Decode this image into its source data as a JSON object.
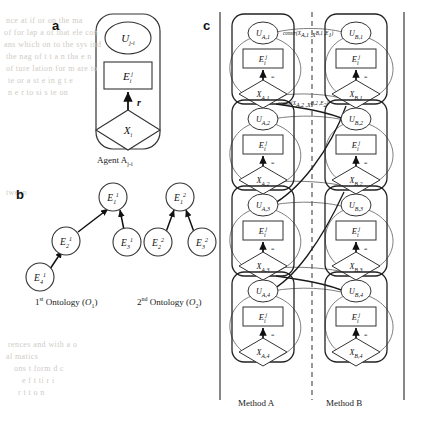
{
  "figure": {
    "panels": [
      {
        "id": "a",
        "letter": "a"
      },
      {
        "id": "b",
        "letter": "b"
      },
      {
        "id": "c",
        "letter": "c"
      }
    ]
  },
  "panel_a": {
    "letter": "a",
    "utility_node": {
      "base": "U",
      "sub": "j-i"
    },
    "entity_node": {
      "base": "E",
      "sub": "i",
      "sup": "j"
    },
    "decision_node": {
      "base": "X",
      "sub": "i"
    },
    "edge_label": "r",
    "caption": {
      "text": "Agent A",
      "sub": "j-i"
    }
  },
  "panel_b": {
    "letter": "b",
    "ontology_1": {
      "caption_prefix": "1",
      "caption_ordinal": "st",
      "caption_text": " Ontology (",
      "caption_symbol": "O",
      "caption_symbol_sub": "1",
      "caption_close": ")",
      "nodes": [
        {
          "id": "E11",
          "base": "E",
          "sub": "1",
          "sup": "1",
          "x": 118,
          "y": 198
        },
        {
          "id": "E21",
          "base": "E",
          "sub": "2",
          "sup": "1",
          "x": 68,
          "y": 241
        },
        {
          "id": "E31",
          "base": "E",
          "sub": "3",
          "sup": "1",
          "x": 118,
          "y": 241
        },
        {
          "id": "E41",
          "base": "E",
          "sub": "4",
          "sup": "1",
          "x": 40,
          "y": 277
        }
      ],
      "edges": [
        {
          "from": "E21",
          "to": "E11"
        },
        {
          "from": "E31",
          "to": "E11"
        },
        {
          "from": "E41",
          "to": "E21"
        }
      ]
    },
    "ontology_2": {
      "caption_prefix": "2",
      "caption_ordinal": "nd",
      "caption_text": " Ontology (",
      "caption_symbol": "O",
      "caption_symbol_sub": "2",
      "caption_close": ")",
      "nodes": [
        {
          "id": "E12",
          "base": "E",
          "sub": "1",
          "sup": "2",
          "x": 178,
          "y": 198
        },
        {
          "id": "E22",
          "base": "E",
          "sub": "2",
          "sup": "2",
          "x": 155,
          "y": 241
        },
        {
          "id": "E32",
          "base": "E",
          "sub": "3",
          "sup": "2",
          "x": 200,
          "y": 241
        }
      ],
      "edges": [
        {
          "from": "E22",
          "to": "E12"
        },
        {
          "from": "E32",
          "to": "E12"
        }
      ]
    }
  },
  "panel_c": {
    "letter": "c",
    "method_a_label": "Method A",
    "method_b_label": "Method B",
    "equality_symbol": "=",
    "edge_label": "r",
    "column_a": {
      "name": "Method A",
      "agents": [
        {
          "utility": {
            "base": "U",
            "sub": "A,1"
          },
          "entity": {
            "base": "E",
            "sub": "i",
            "sup": "j"
          },
          "decision": {
            "base": "X",
            "sub": "A,1"
          }
        },
        {
          "utility": {
            "base": "U",
            "sub": "A,2"
          },
          "entity": {
            "base": "E",
            "sub": "i",
            "sup": "j"
          },
          "decision": {
            "base": "X",
            "sub": "A,2"
          }
        },
        {
          "utility": {
            "base": "U",
            "sub": "A,3"
          },
          "entity": {
            "base": "E",
            "sub": "i",
            "sup": "j"
          },
          "decision": {
            "base": "X",
            "sub": "A,3"
          }
        },
        {
          "utility": {
            "base": "U",
            "sub": "A,4"
          },
          "entity": {
            "base": "E",
            "sub": "i",
            "sup": "j"
          },
          "decision": {
            "base": "X",
            "sub": "A,4"
          }
        }
      ]
    },
    "column_b": {
      "name": "Method B",
      "agents": [
        {
          "utility": {
            "base": "U",
            "sub": "B,1"
          },
          "entity": {
            "base": "E",
            "sub": "i",
            "sup": "j"
          },
          "decision": {
            "base": "X",
            "sub": "B,1"
          }
        },
        {
          "utility": {
            "base": "U",
            "sub": "B,2"
          },
          "entity": {
            "base": "E",
            "sub": "i",
            "sup": "j"
          },
          "decision": {
            "base": "X",
            "sub": "B,2"
          }
        },
        {
          "utility": {
            "base": "U",
            "sub": "B,3"
          },
          "entity": {
            "base": "E",
            "sub": "i",
            "sup": "j"
          },
          "decision": {
            "base": "X",
            "sub": "B,3"
          }
        },
        {
          "utility": {
            "base": "U",
            "sub": "B,4"
          },
          "entity": {
            "base": "E",
            "sub": "i",
            "sup": "j"
          },
          "decision": {
            "base": "X",
            "sub": "B,4"
          }
        }
      ]
    },
    "constraints": [
      {
        "id": "c1",
        "label": "constr(X",
        "args": "A,1 ,X",
        "args2": "B,1 ,E",
        "args3": "1",
        "full": "constr(XA,1,XB,1,E1)",
        "x": 283,
        "y": 34
      },
      {
        "id": "c2",
        "label": "constr(X",
        "args": "A,2 ,X",
        "args2": "B,2 ,E",
        "args3": "2",
        "full": "constr(XA,2,XB,2,E2)",
        "x": 278,
        "y": 104
      }
    ]
  },
  "colors": {
    "ink": "#111111",
    "line": "#333333",
    "arc": "#6e6e6e",
    "bleed": "#cfcbc6",
    "background": "#ffffff"
  },
  "bleed_text": [
    {
      "t": "nce  at  if  or  on  the  ma",
      "x": 6,
      "y": 16
    },
    {
      "t": "of  for  lap  a  of  that  ele  con",
      "x": 4,
      "y": 28
    },
    {
      "t": "ans  which  on  to  the  sys  ind",
      "x": 4,
      "y": 40
    },
    {
      "t": "the  nag  of  t  t  a  n  tha  e  n",
      "x": 6,
      "y": 52
    },
    {
      "t": "of  ture   lation  for  m   are  to",
      "x": 6,
      "y": 64
    },
    {
      "t": "te   or  a  st  e  in  g  t  e",
      "x": 8,
      "y": 76
    },
    {
      "t": "n  e  r  to  si  s  te  on",
      "x": 8,
      "y": 88
    },
    {
      "t": "tween",
      "x": 6,
      "y": 188
    },
    {
      "t": "rences  and  with  a  o",
      "x": 8,
      "y": 340
    },
    {
      "t": "al  matics",
      "x": 6,
      "y": 352
    },
    {
      "t": "ons  t  form  d  c",
      "x": 14,
      "y": 364
    },
    {
      "t": "e    f   t   ti   r   i",
      "x": 22,
      "y": 376
    },
    {
      "t": "r   t   t   o   n",
      "x": 18,
      "y": 388
    }
  ]
}
